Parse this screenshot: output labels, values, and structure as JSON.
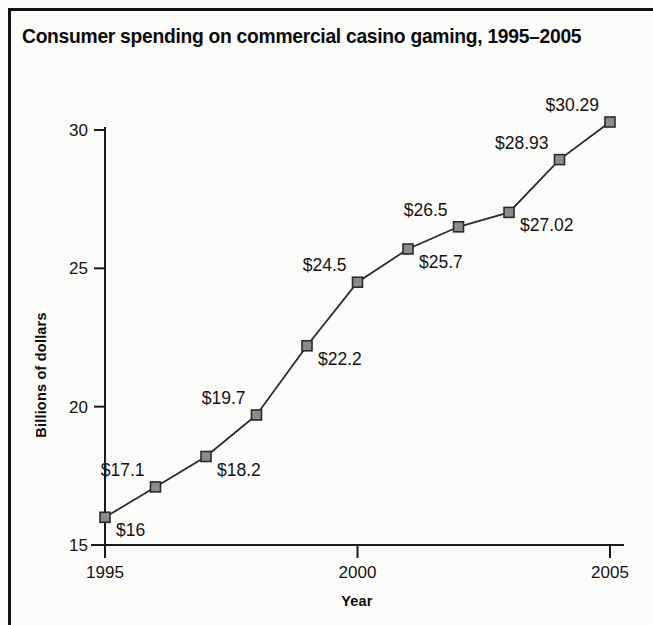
{
  "figure": {
    "title": "Consumer spending on commercial casino gaming, 1995–2005",
    "frame_color": "#111111",
    "background_color": "#fbfbf9"
  },
  "chart_data": {
    "type": "line",
    "title": "Consumer spending on commercial casino gaming, 1995–2005",
    "xlabel": "Year",
    "ylabel": "Billions of dollars",
    "x": [
      1995,
      1996,
      1997,
      1998,
      1999,
      2000,
      2001,
      2002,
      2003,
      2004,
      2005
    ],
    "values": [
      16,
      17.1,
      18.2,
      19.7,
      22.2,
      24.5,
      25.7,
      26.5,
      27.02,
      28.93,
      30.29
    ],
    "point_labels": [
      "$16",
      "$17.1",
      "$18.2",
      "$19.7",
      "$22.2",
      "$24.5",
      "$25.7",
      "$26.5",
      "$27.02",
      "$28.93",
      "$30.29"
    ],
    "label_positions": [
      "below-right",
      "above-left",
      "below-right",
      "above-left",
      "below-right",
      "above-left",
      "below-right",
      "above-left",
      "below-right",
      "above-left",
      "above-left"
    ],
    "xlim": [
      1995,
      2005
    ],
    "ylim": [
      15,
      30
    ],
    "xticks": [
      1995,
      2000,
      2005
    ],
    "xticklabels": [
      "1995",
      "2000",
      "2005"
    ],
    "yticks": [
      15,
      20,
      25,
      30
    ],
    "yticklabels": [
      "15",
      "20",
      "25",
      "30"
    ],
    "grid": false,
    "legend": false,
    "marker": "square",
    "marker_fill": "#8c8c8c",
    "marker_edge": "#2b2b2b",
    "line_color": "#2b2b2b",
    "axis_color": "#1a1a1a"
  }
}
